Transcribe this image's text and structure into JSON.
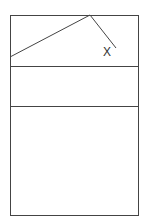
{
  "diagram": {
    "line_color": "#444444",
    "background": "#ffffff",
    "outer_box": {
      "x": 10,
      "y": 15,
      "width": 128,
      "height": 200
    },
    "dividers": [
      {
        "y": 66
      },
      {
        "y": 106
      }
    ],
    "polyline": {
      "points": [
        [
          10,
          57
        ],
        [
          90,
          15
        ],
        [
          116,
          48
        ]
      ]
    },
    "labels": [
      {
        "text": "X",
        "x": 103,
        "y": 46
      }
    ]
  }
}
